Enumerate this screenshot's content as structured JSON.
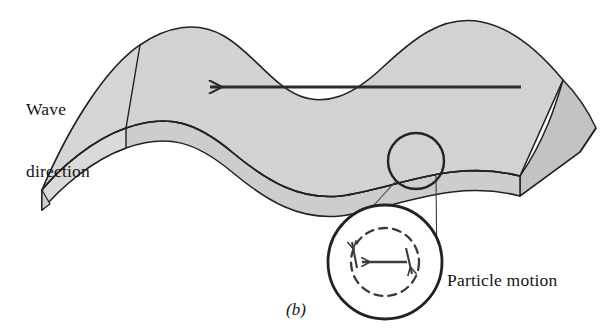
{
  "figure": {
    "panel_letter": "(b)",
    "wave_direction_label_line1": "Wave",
    "wave_direction_label_line2": "direction",
    "particle_motion_label": "Particle motion",
    "colors": {
      "surface_fill": "#d2d2d2",
      "side_face_fill": "#cfcfcf",
      "outline": "#222222",
      "arrow": "#2b2b2b",
      "background": "#ffffff",
      "detail_circle_stroke": "#222222",
      "dashed_circle_stroke": "#3a3a3a"
    },
    "icons": {
      "wave_direction_arrow": "long-left-arrow-icon",
      "particle_linear_arrow": "left-arrow-icon",
      "particle_orbit_up_arrow": "orbit-up-arrow-icon",
      "particle_orbit_down_arrow": "orbit-down-arrow-icon",
      "callout_circle": "callout-circle-icon",
      "magnified_circle": "magnified-circle-icon",
      "orbit_dashed_circle": "dashed-orbit-circle-icon"
    },
    "geometry": {
      "wave_top_crest_x": [
        190,
        430
      ],
      "wave_top_trough_x": [
        310,
        545
      ],
      "callout_circle_center": [
        416,
        161
      ],
      "callout_circle_radius": 28,
      "magnified_circle_center": [
        385,
        262
      ],
      "magnified_circle_radius": 57,
      "dashed_orbit_radius": 34,
      "wave_arrow_tail": [
        521,
        87
      ],
      "wave_arrow_head": [
        205,
        87
      ]
    }
  }
}
